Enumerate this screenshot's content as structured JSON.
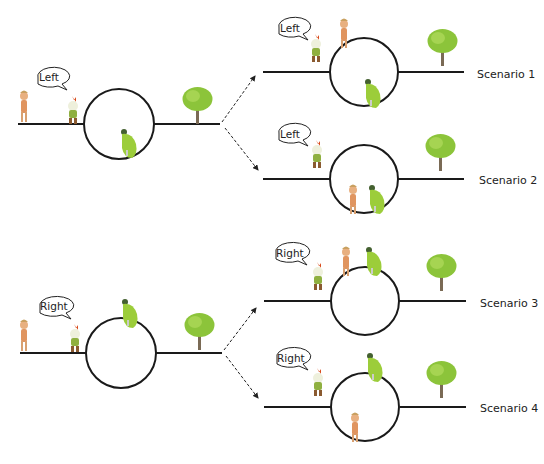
{
  "diagram": {
    "type": "scenario-diagram",
    "colors": {
      "track": "#1a1a1a",
      "tree_foliage": "#8cc43a",
      "tree_trunk": "#7a6a55",
      "frog": "#9ccd3a",
      "person_skin": "#e8b080",
      "chicken_comb": "#d84a1a"
    },
    "initial_states": [
      {
        "id": "left-initial",
        "speech": "Left",
        "frog_position": "inside-bottom-right",
        "branches_to": [
          "Scenario 1",
          "Scenario 2"
        ]
      },
      {
        "id": "right-initial",
        "speech": "Right",
        "frog_position": "on-top",
        "branches_to": [
          "Scenario 3",
          "Scenario 4"
        ]
      }
    ],
    "scenarios": [
      {
        "label": "Scenario 1",
        "speech": "Left",
        "person_position": "on-top-left",
        "frog_position": "inside-bottom-right"
      },
      {
        "label": "Scenario 2",
        "speech": "Left",
        "person_position": "inside-bottom",
        "frog_position": "inside-bottom-right"
      },
      {
        "label": "Scenario 3",
        "speech": "Right",
        "person_position": "on-top-left",
        "frog_position": "on-top"
      },
      {
        "label": "Scenario 4",
        "speech": "Right",
        "person_position": "inside-bottom",
        "frog_position": "on-top"
      }
    ]
  }
}
